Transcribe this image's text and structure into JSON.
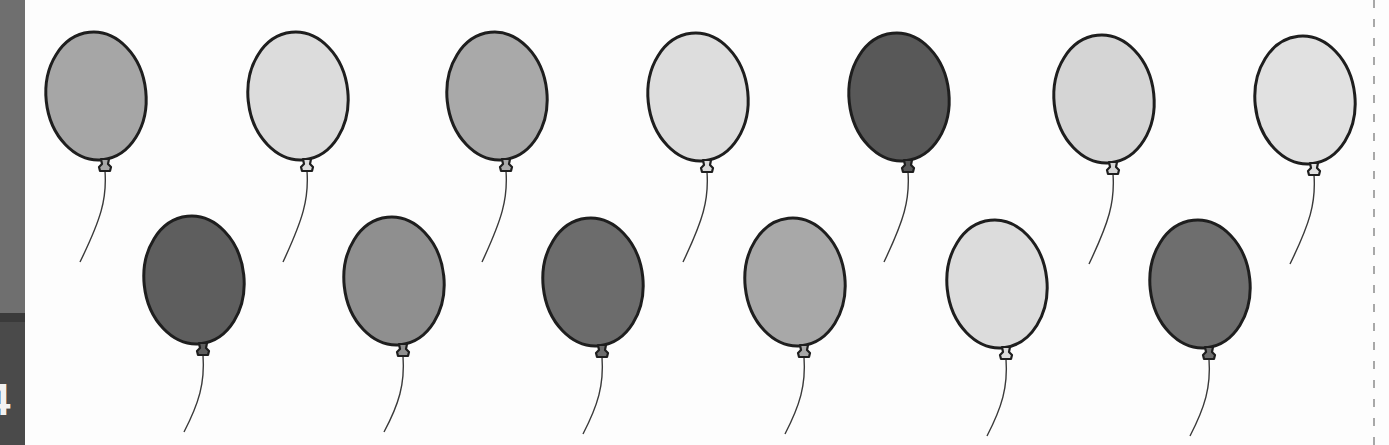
{
  "page": {
    "page_number": "4",
    "background": "#fdfdfd"
  },
  "side_tab": {
    "upper_color": "#6f6f6f",
    "band_color": "#3a3a3a",
    "lower_color": "#4a4a4a"
  },
  "balloon_style": {
    "outline_color": "#1e1e1e",
    "string_color": "#3a3a3a",
    "rx": 50,
    "ry": 64
  },
  "balloons": {
    "top_row": [
      {
        "id": "balloon-1",
        "cx": 96,
        "cy": 96,
        "fill": "#a6a6a6",
        "string_end": [
          80,
          262
        ]
      },
      {
        "id": "balloon-2",
        "cx": 298,
        "cy": 96,
        "fill": "#dcdcdc",
        "string_end": [
          283,
          262
        ]
      },
      {
        "id": "balloon-3",
        "cx": 497,
        "cy": 96,
        "fill": "#a9a9a9",
        "string_end": [
          482,
          262
        ]
      },
      {
        "id": "balloon-4",
        "cx": 698,
        "cy": 97,
        "fill": "#dddddd",
        "string_end": [
          683,
          262
        ]
      },
      {
        "id": "balloon-5",
        "cx": 899,
        "cy": 97,
        "fill": "#585858",
        "string_end": [
          884,
          262
        ]
      },
      {
        "id": "balloon-6",
        "cx": 1104,
        "cy": 99,
        "fill": "#d5d5d5",
        "string_end": [
          1089,
          264
        ]
      },
      {
        "id": "balloon-7",
        "cx": 1305,
        "cy": 100,
        "fill": "#e1e1e1",
        "string_end": [
          1290,
          264
        ]
      }
    ],
    "bottom_row": [
      {
        "id": "balloon-8",
        "cx": 194,
        "cy": 280,
        "fill": "#5e5e5e",
        "string_end": [
          184,
          432
        ]
      },
      {
        "id": "balloon-9",
        "cx": 394,
        "cy": 281,
        "fill": "#8f8f8f",
        "string_end": [
          384,
          432
        ]
      },
      {
        "id": "balloon-10",
        "cx": 593,
        "cy": 282,
        "fill": "#6c6c6c",
        "string_end": [
          583,
          434
        ]
      },
      {
        "id": "balloon-11",
        "cx": 795,
        "cy": 282,
        "fill": "#a8a8a8",
        "string_end": [
          785,
          434
        ]
      },
      {
        "id": "balloon-12",
        "cx": 997,
        "cy": 284,
        "fill": "#dcdcdc",
        "string_end": [
          987,
          436
        ]
      },
      {
        "id": "balloon-13",
        "cx": 1200,
        "cy": 284,
        "fill": "#6e6e6e",
        "string_end": [
          1190,
          436
        ]
      }
    ]
  },
  "cut_line": {
    "color": "#a8a8a8",
    "style": "dashed"
  }
}
